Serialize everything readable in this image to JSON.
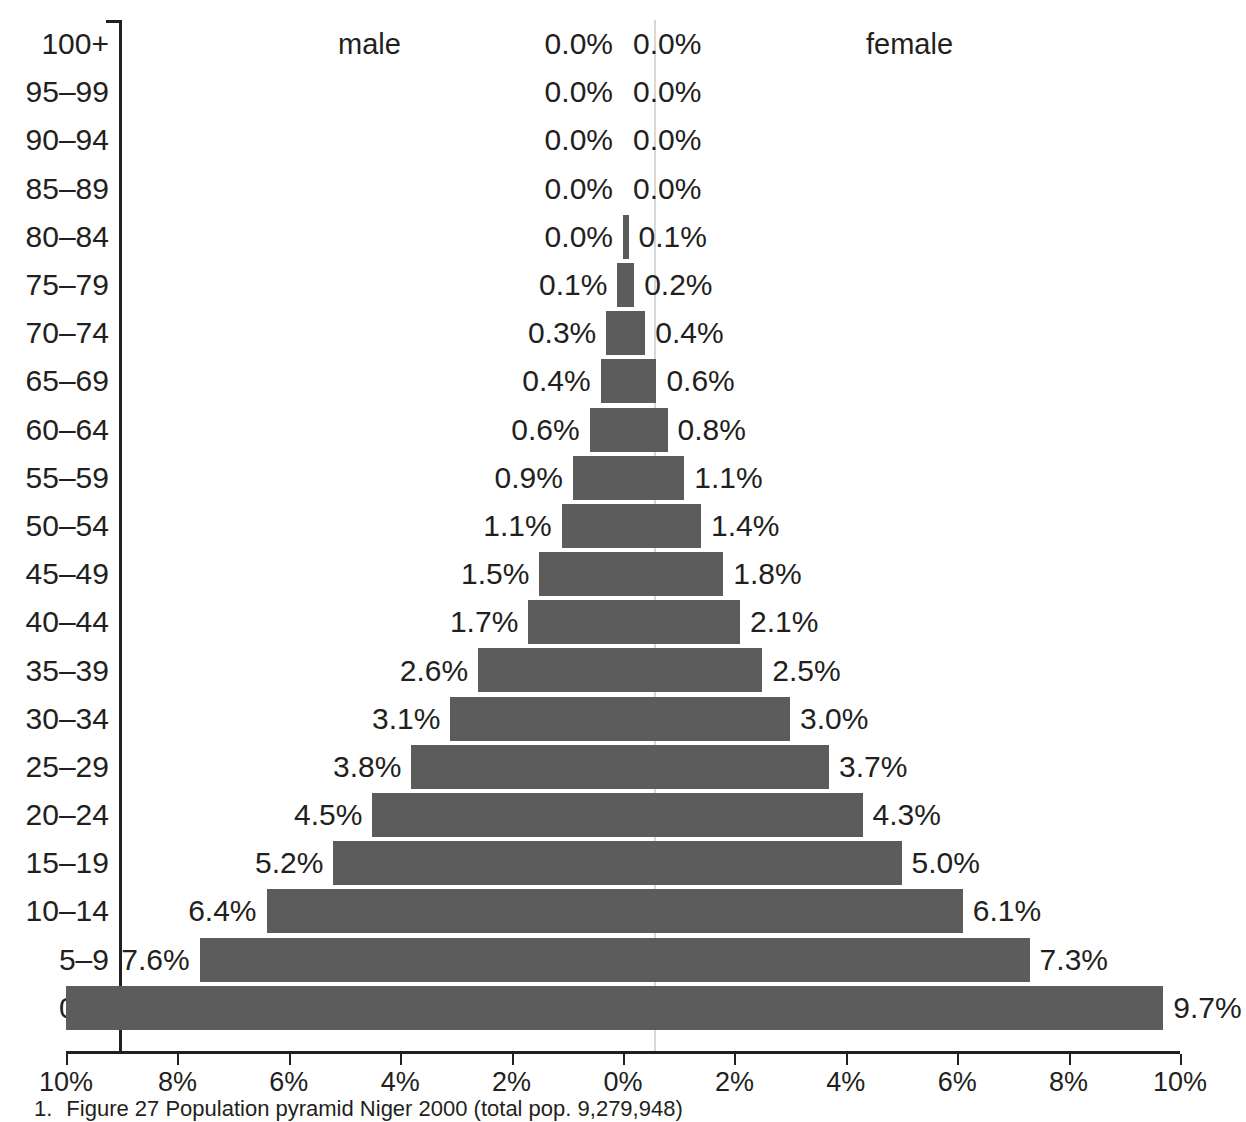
{
  "chart_data": {
    "type": "bar",
    "subtype": "population-pyramid",
    "title": "",
    "xlabel": "",
    "ylabel": "",
    "xlim": [
      -10,
      10
    ],
    "xticks": [
      "10%",
      "8%",
      "6%",
      "4%",
      "2%",
      "0%",
      "2%",
      "4%",
      "6%",
      "8%",
      "10%"
    ],
    "xtick_values": [
      -10,
      -8,
      -6,
      -4,
      -2,
      0,
      2,
      4,
      6,
      8,
      10
    ],
    "grid": false,
    "legend_position": "top-inline",
    "series": [
      {
        "name": "male",
        "side": "left"
      },
      {
        "name": "female",
        "side": "right"
      }
    ],
    "categories": [
      "100+",
      "95-99",
      "90-94",
      "85-89",
      "80-84",
      "75-79",
      "70-74",
      "65-69",
      "60-64",
      "55-59",
      "50-54",
      "45-49",
      "40-44",
      "35-39",
      "30-34",
      "25-29",
      "20-24",
      "15-19",
      "10-14",
      "5-9",
      "0-4"
    ],
    "male_values": [
      0.0,
      0.0,
      0.0,
      0.0,
      0.0,
      0.1,
      0.3,
      0.4,
      0.6,
      0.9,
      1.1,
      1.5,
      1.7,
      2.6,
      3.1,
      3.8,
      4.5,
      5.2,
      6.4,
      7.6,
      10.0
    ],
    "female_values": [
      0.0,
      0.0,
      0.0,
      0.0,
      0.1,
      0.2,
      0.4,
      0.6,
      0.8,
      1.1,
      1.4,
      1.8,
      2.1,
      2.5,
      3.0,
      3.7,
      4.3,
      5.0,
      6.1,
      7.3,
      9.7
    ],
    "male_labels": [
      "0.0%",
      "0.0%",
      "0.0%",
      "0.0%",
      "0.0%",
      "0.1%",
      "0.3%",
      "0.4%",
      "0.6%",
      "0.9%",
      "1.1%",
      "1.5%",
      "1.7%",
      "2.6%",
      "3.1%",
      "3.8%",
      "4.5%",
      "5.2%",
      "6.4%",
      "7.6%",
      ""
    ],
    "female_labels": [
      "0.0%",
      "0.0%",
      "0.0%",
      "0.0%",
      "0.1%",
      "0.2%",
      "0.4%",
      "0.6%",
      "0.8%",
      "1.1%",
      "1.4%",
      "1.8%",
      "2.1%",
      "2.5%",
      "3.0%",
      "3.7%",
      "4.3%",
      "5.0%",
      "6.1%",
      "7.3%",
      "9.7%"
    ],
    "bar_color": "#5c5c5c",
    "axis_color": "#231f20"
  },
  "legend": {
    "male": "male",
    "female": "female"
  },
  "caption": {
    "number": "1.",
    "text": "Figure 27 Population pyramid Niger 2000 (total pop. 9,279,948)"
  }
}
